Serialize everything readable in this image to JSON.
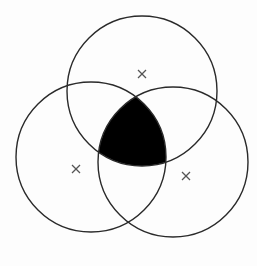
{
  "diagram": {
    "type": "venn",
    "sets": 3,
    "circles": [
      {
        "name": "top",
        "cx": 142,
        "cy": 91,
        "r": 75,
        "marker": [
          142,
          74
        ]
      },
      {
        "name": "left",
        "cx": 91,
        "cy": 157,
        "r": 75,
        "marker": [
          76,
          169
        ]
      },
      {
        "name": "right",
        "cx": 173,
        "cy": 162,
        "r": 75,
        "marker": [
          186,
          176
        ]
      }
    ],
    "highlighted_region": "intersection of all three circles",
    "fill_color": "#000000",
    "stroke_color": "#2a2a2a",
    "marker_color": "#555555"
  }
}
